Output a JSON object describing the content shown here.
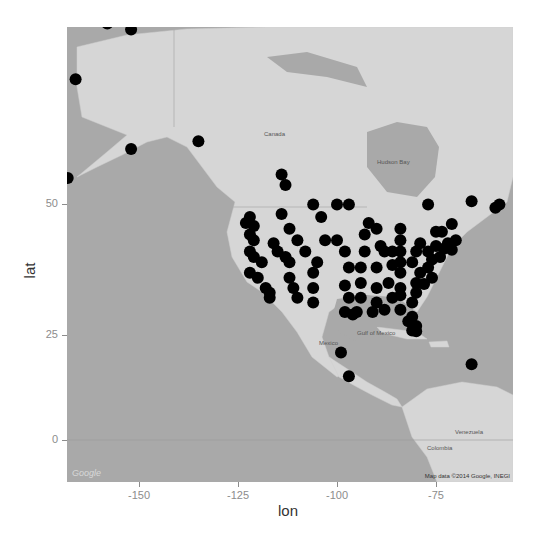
{
  "chart_data": {
    "type": "scatter",
    "title": "",
    "xlabel": "lon",
    "ylabel": "lat",
    "x_ticks": [
      -150,
      -125,
      -100,
      -75
    ],
    "y_ticks": [
      0,
      25,
      50
    ],
    "xlim": [
      -170,
      -57
    ],
    "ylim": [
      -10,
      78
    ],
    "grid": false,
    "legend": null,
    "background": "Google map tiles (grayscale, Mercator)",
    "point_color": "#000000",
    "points": [
      {
        "lon": -158,
        "lat": 71
      },
      {
        "lon": -152,
        "lat": 70.5
      },
      {
        "lon": -166,
        "lat": 66
      },
      {
        "lon": -152,
        "lat": 58
      },
      {
        "lon": -135,
        "lat": 59
      },
      {
        "lon": -168,
        "lat": 54
      },
      {
        "lon": -122,
        "lat": 48
      },
      {
        "lon": -123,
        "lat": 47
      },
      {
        "lon": -121,
        "lat": 46.5
      },
      {
        "lon": -122,
        "lat": 45
      },
      {
        "lon": -121,
        "lat": 44
      },
      {
        "lon": -122,
        "lat": 42
      },
      {
        "lon": -121,
        "lat": 41
      },
      {
        "lon": -119,
        "lat": 40
      },
      {
        "lon": -122,
        "lat": 38
      },
      {
        "lon": -120,
        "lat": 37
      },
      {
        "lon": -118,
        "lat": 35
      },
      {
        "lon": -117,
        "lat": 34
      },
      {
        "lon": -117,
        "lat": 33
      },
      {
        "lon": -114,
        "lat": 54.5
      },
      {
        "lon": -113,
        "lat": 53
      },
      {
        "lon": -114,
        "lat": 48.5
      },
      {
        "lon": -112,
        "lat": 46
      },
      {
        "lon": -110,
        "lat": 44
      },
      {
        "lon": -106,
        "lat": 50
      },
      {
        "lon": -104,
        "lat": 48
      },
      {
        "lon": -100,
        "lat": 50
      },
      {
        "lon": -97,
        "lat": 50
      },
      {
        "lon": -116,
        "lat": 43.5
      },
      {
        "lon": -115,
        "lat": 42
      },
      {
        "lon": -113,
        "lat": 41
      },
      {
        "lon": -112,
        "lat": 40
      },
      {
        "lon": -108,
        "lat": 42
      },
      {
        "lon": -105,
        "lat": 40
      },
      {
        "lon": -106,
        "lat": 38
      },
      {
        "lon": -112,
        "lat": 37
      },
      {
        "lon": -111,
        "lat": 35
      },
      {
        "lon": -110,
        "lat": 33
      },
      {
        "lon": -106,
        "lat": 35
      },
      {
        "lon": -106,
        "lat": 32
      },
      {
        "lon": -103,
        "lat": 44
      },
      {
        "lon": -100,
        "lat": 44
      },
      {
        "lon": -98,
        "lat": 42
      },
      {
        "lon": -97,
        "lat": 39
      },
      {
        "lon": -98,
        "lat": 35.5
      },
      {
        "lon": -97,
        "lat": 33
      },
      {
        "lon": -98,
        "lat": 30
      },
      {
        "lon": -96,
        "lat": 29.5
      },
      {
        "lon": -95,
        "lat": 30
      },
      {
        "lon": -94,
        "lat": 33
      },
      {
        "lon": -94,
        "lat": 36
      },
      {
        "lon": -94,
        "lat": 39
      },
      {
        "lon": -93,
        "lat": 42
      },
      {
        "lon": -93,
        "lat": 45
      },
      {
        "lon": -92,
        "lat": 47
      },
      {
        "lon": -90,
        "lat": 46
      },
      {
        "lon": -89,
        "lat": 43
      },
      {
        "lon": -88,
        "lat": 42
      },
      {
        "lon": -90,
        "lat": 39
      },
      {
        "lon": -90,
        "lat": 35
      },
      {
        "lon": -90,
        "lat": 32
      },
      {
        "lon": -91,
        "lat": 30
      },
      {
        "lon": -88,
        "lat": 30.5
      },
      {
        "lon": -86,
        "lat": 33
      },
      {
        "lon": -87,
        "lat": 36
      },
      {
        "lon": -86,
        "lat": 39.5
      },
      {
        "lon": -86,
        "lat": 42
      },
      {
        "lon": -84,
        "lat": 44
      },
      {
        "lon": -84,
        "lat": 46
      },
      {
        "lon": -84,
        "lat": 42
      },
      {
        "lon": -84,
        "lat": 40
      },
      {
        "lon": -84,
        "lat": 38
      },
      {
        "lon": -84,
        "lat": 35
      },
      {
        "lon": -84,
        "lat": 33.5
      },
      {
        "lon": -84,
        "lat": 30.5
      },
      {
        "lon": -82,
        "lat": 28
      },
      {
        "lon": -81,
        "lat": 26
      },
      {
        "lon": -80,
        "lat": 25.8
      },
      {
        "lon": -80,
        "lat": 27
      },
      {
        "lon": -81,
        "lat": 29
      },
      {
        "lon": -81,
        "lat": 32
      },
      {
        "lon": -80,
        "lat": 34
      },
      {
        "lon": -80,
        "lat": 36
      },
      {
        "lon": -79,
        "lat": 38
      },
      {
        "lon": -81,
        "lat": 40
      },
      {
        "lon": -80,
        "lat": 42
      },
      {
        "lon": -79,
        "lat": 43.5
      },
      {
        "lon": -77,
        "lat": 39
      },
      {
        "lon": -76,
        "lat": 40.5
      },
      {
        "lon": -77,
        "lat": 42
      },
      {
        "lon": -75,
        "lat": 43
      },
      {
        "lon": -74,
        "lat": 41
      },
      {
        "lon": -73,
        "lat": 42.5
      },
      {
        "lon": -72,
        "lat": 43.5
      },
      {
        "lon": -71,
        "lat": 42.3
      },
      {
        "lon": -70,
        "lat": 44
      },
      {
        "lon": -75,
        "lat": 45.5
      },
      {
        "lon": -73.5,
        "lat": 45.5
      },
      {
        "lon": -71,
        "lat": 46.8
      },
      {
        "lon": -77,
        "lat": 50
      },
      {
        "lon": -66,
        "lat": 50.5
      },
      {
        "lon": -60,
        "lat": 49.5
      },
      {
        "lon": -59,
        "lat": 50
      },
      {
        "lon": -76,
        "lat": 37
      },
      {
        "lon": -78,
        "lat": 35.8
      },
      {
        "lon": -99,
        "lat": 21
      },
      {
        "lon": -97,
        "lat": 15.5
      },
      {
        "lon": -66,
        "lat": 18.3
      }
    ]
  },
  "axes": {
    "xlabel": "lon",
    "ylabel": "lat",
    "x_ticks": [
      {
        "label": "-150",
        "x": 139
      },
      {
        "label": "-125",
        "x": 238
      },
      {
        "label": "-100",
        "x": 337
      },
      {
        "label": "-75",
        "x": 436
      }
    ],
    "y_ticks": [
      {
        "label": "50",
        "y": 204
      },
      {
        "label": "25",
        "y": 335
      },
      {
        "label": "0",
        "y": 440
      }
    ]
  },
  "map": {
    "labels": {
      "canada": "Canada",
      "mexico": "Mexico",
      "venezuela": "Venezuela",
      "colombia": "Colombia",
      "hudson_bay": "Hudson Bay",
      "gulf_of_mexico": "Gulf of Mexico"
    },
    "credits": "Map data ©2014 Google, INEGI",
    "logo": "Google"
  }
}
